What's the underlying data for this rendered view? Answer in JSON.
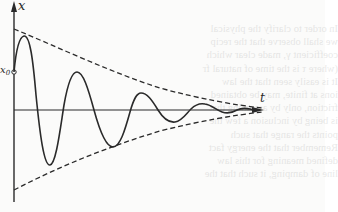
{
  "figure": {
    "axis_labels": {
      "vertical": "x",
      "horizontal": "t",
      "initial_displacement": "x",
      "initial_displacement_subscript": "0"
    },
    "colors": {
      "ink": "#2a2a2a",
      "paper": "#fbfbfa"
    }
  },
  "bleed_through_text": {
    "lines": [
      "In order to clarify the physical",
      "we shall observe that the recip",
      "coefficient γ, made clear which",
      "(where τ is the time of natural fr",
      "It is easily seen that the law",
      "ions at finite, may be obtained",
      "friction, only by assuming that",
      "is being by inclusion a few the",
      "points the range that such",
      "Remember that the energy fact",
      "defined meaning for this law",
      "line of damping, it such that the"
    ]
  }
}
